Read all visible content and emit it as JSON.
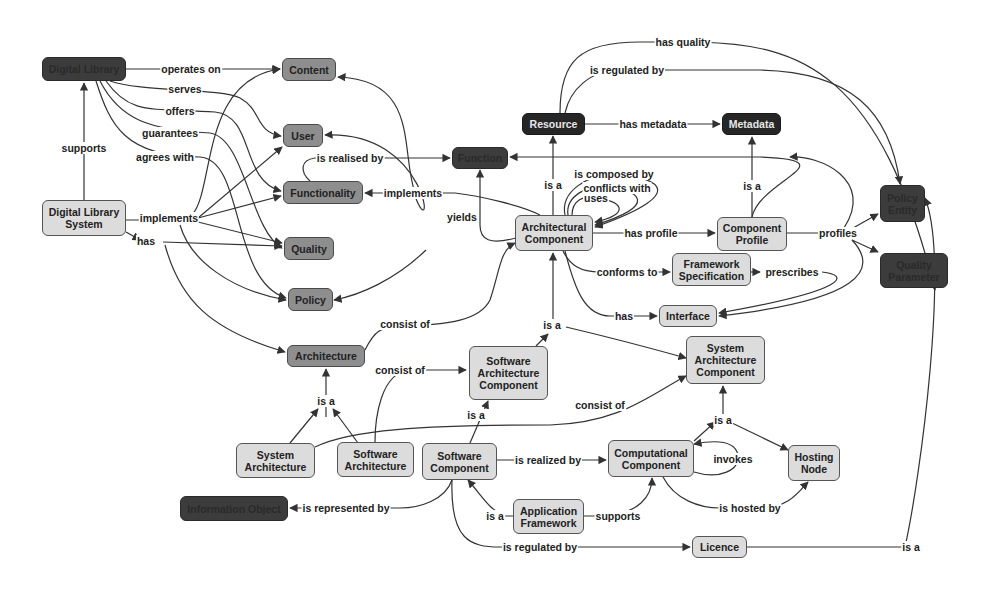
{
  "diagram": {
    "title": "",
    "colors": {
      "light": "#dcdcdc",
      "mid": "#8e8e8e",
      "dark": "#3c3c3c",
      "black": "#262626",
      "edge": "#333333"
    },
    "nodes": [
      {
        "id": "digital_library",
        "label": "Digital Library",
        "style": "dark",
        "x": 42,
        "y": 57,
        "w": 84,
        "h": 24
      },
      {
        "id": "dls",
        "label": "Digital Library System",
        "style": "light",
        "x": 42,
        "y": 200,
        "w": 84,
        "h": 36
      },
      {
        "id": "content",
        "label": "Content",
        "style": "mid",
        "x": 282,
        "y": 58,
        "w": 54,
        "h": 23
      },
      {
        "id": "user",
        "label": "User",
        "style": "mid",
        "x": 283,
        "y": 124,
        "w": 40,
        "h": 23
      },
      {
        "id": "functionality",
        "label": "Functionality",
        "style": "mid",
        "x": 283,
        "y": 181,
        "w": 80,
        "h": 23
      },
      {
        "id": "quality",
        "label": "Quality",
        "style": "mid",
        "x": 284,
        "y": 237,
        "w": 50,
        "h": 23
      },
      {
        "id": "policy",
        "label": "Policy",
        "style": "mid",
        "x": 288,
        "y": 288,
        "w": 45,
        "h": 23
      },
      {
        "id": "architecture",
        "label": "Architecture",
        "style": "mid",
        "x": 287,
        "y": 345,
        "w": 78,
        "h": 22
      },
      {
        "id": "function",
        "label": "Function",
        "style": "dark",
        "x": 452,
        "y": 147,
        "w": 56,
        "h": 22
      },
      {
        "id": "resource",
        "label": "Resource",
        "style": "black",
        "x": 522,
        "y": 113,
        "w": 63,
        "h": 22
      },
      {
        "id": "metadata",
        "label": "Metadata",
        "style": "black",
        "x": 722,
        "y": 113,
        "w": 59,
        "h": 22
      },
      {
        "id": "arch_component",
        "label": "Architectural Component",
        "style": "light",
        "x": 515,
        "y": 215,
        "w": 78,
        "h": 36
      },
      {
        "id": "component_profile",
        "label": "Component Profile",
        "style": "light",
        "x": 717,
        "y": 217,
        "w": 70,
        "h": 34
      },
      {
        "id": "framework_spec",
        "label": "Framework Specification",
        "style": "light",
        "x": 672,
        "y": 253,
        "w": 79,
        "h": 33
      },
      {
        "id": "interface",
        "label": "Interface",
        "style": "light",
        "x": 659,
        "y": 305,
        "w": 58,
        "h": 22
      },
      {
        "id": "policy_entity",
        "label": "Policy Entity",
        "style": "dark",
        "x": 880,
        "y": 185,
        "w": 45,
        "h": 37
      },
      {
        "id": "quality_parameter",
        "label": "Quality Parameter",
        "style": "dark",
        "x": 880,
        "y": 253,
        "w": 68,
        "h": 35
      },
      {
        "id": "sw_arch_component",
        "label": "Software Architecture Component",
        "style": "light",
        "x": 469,
        "y": 346,
        "w": 79,
        "h": 54
      },
      {
        "id": "sys_arch_component",
        "label": "System Architecture Component",
        "style": "light",
        "x": 686,
        "y": 336,
        "w": 79,
        "h": 48
      },
      {
        "id": "system_architecture",
        "label": "System Architecture",
        "style": "light",
        "x": 236,
        "y": 443,
        "w": 79,
        "h": 35
      },
      {
        "id": "software_architecture",
        "label": "Software Architecture",
        "style": "light",
        "x": 337,
        "y": 442,
        "w": 77,
        "h": 35
      },
      {
        "id": "software_component",
        "label": "Software Component",
        "style": "light",
        "x": 422,
        "y": 443,
        "w": 75,
        "h": 37
      },
      {
        "id": "computational_component",
        "label": "Computational Component",
        "style": "light",
        "x": 608,
        "y": 440,
        "w": 86,
        "h": 37
      },
      {
        "id": "hosting_node",
        "label": "Hosting Node",
        "style": "light",
        "x": 788,
        "y": 445,
        "w": 52,
        "h": 36
      },
      {
        "id": "information_object",
        "label": "Information Object",
        "style": "dark",
        "x": 180,
        "y": 496,
        "w": 108,
        "h": 25
      },
      {
        "id": "application_framework",
        "label": "Application Framework",
        "style": "light",
        "x": 513,
        "y": 499,
        "w": 71,
        "h": 35
      },
      {
        "id": "licence",
        "label": "Licence",
        "style": "light",
        "x": 692,
        "y": 536,
        "w": 55,
        "h": 22
      }
    ],
    "edges": [
      {
        "label": "operates on",
        "path": "M126 69 L280 69",
        "lx": 191,
        "ly": 69
      },
      {
        "label": "serves",
        "path": "M110 81 C140 92 220 88 240 98 C262 110 255 132 281 136",
        "lx": 185,
        "ly": 89
      },
      {
        "label": "offers",
        "path": "M106 81 C130 115 150 108 215 112 C255 116 240 180 281 191",
        "lx": 180,
        "ly": 111
      },
      {
        "label": "guarantees",
        "path": "M100 81 C120 120 150 130 210 133 C245 138 250 230 282 248",
        "lx": 170,
        "ly": 133
      },
      {
        "label": "agrees with",
        "path": "M96 81 C110 125 125 157 200 157 C245 160 230 280 286 298",
        "lx": 165,
        "ly": 157
      },
      {
        "label": "supports",
        "path": "M84 200 L84 83",
        "lx": 84,
        "ly": 148
      },
      {
        "label": "implements",
        "path": "M126 220 L160 220",
        "lx": 169,
        "ly": 218
      },
      {
        "label": "",
        "path": "M192 215 C215 190 200 80 280 69",
        "lx": 0,
        "ly": 0
      },
      {
        "label": "",
        "path": "M198 218 L282 147",
        "lx": 0,
        "ly": 0
      },
      {
        "label": "",
        "path": "M198 218 L281 196",
        "lx": 0,
        "ly": 0
      },
      {
        "label": "",
        "path": "M198 222 L282 243",
        "lx": 0,
        "ly": 0
      },
      {
        "label": "",
        "path": "M180 225 C190 260 230 290 286 300",
        "lx": 0,
        "ly": 0
      },
      {
        "label": "has",
        "path": "M126 232 L140 240",
        "lx": 146,
        "ly": 241
      },
      {
        "label": "",
        "path": "M163 242 L282 246",
        "lx": 0,
        "ly": 0
      },
      {
        "label": "",
        "path": "M165 245 C180 300 210 330 285 352",
        "lx": 0,
        "ly": 0
      },
      {
        "label": "is realised by",
        "path": "M310 181 C300 172 300 160 315 158 L450 158",
        "lx": 350,
        "ly": 158
      },
      {
        "label": "implements",
        "path": "M540 215 C520 205 480 196 455 193 L365 193",
        "lx": 413,
        "ly": 193
      },
      {
        "label": "",
        "path": "M415 193 C400 150 420 80 338 77",
        "lx": 0,
        "ly": 0
      },
      {
        "label": "",
        "path": "M415 196 C435 250 430 130 325 135",
        "lx": 0,
        "ly": 0
      },
      {
        "label": "",
        "path": "M426 250 C395 280 360 295 334 300",
        "lx": 0,
        "ly": 0
      },
      {
        "label": "yields",
        "path": "M516 238 C490 245 480 240 480 225 L480 170",
        "lx": 462,
        "ly": 217
      },
      {
        "label": "is a",
        "path": "M553 215 L553 136",
        "lx": 553,
        "ly": 185
      },
      {
        "label": "has metadata",
        "path": "M585 124 L720 124",
        "lx": 653,
        "ly": 124
      },
      {
        "label": "has quality",
        "path": "M560 113 C560 60 580 42 640 42 L700 42 C800 45 880 70 935 290",
        "lx": 683,
        "ly": 42
      },
      {
        "label": "is regulated by",
        "path": "M565 113 C570 90 590 70 620 70 L760 70 C850 72 890 110 900 184",
        "lx": 627,
        "ly": 70
      },
      {
        "label": "",
        "path": "M752 217 C760 180 850 160 760 157 L510 157",
        "lx": 0,
        "ly": 0
      },
      {
        "label": "is composed by",
        "path": "M565 215 C560 190 590 175 610 175 C650 175 700 190 595 227",
        "lx": 614,
        "ly": 174
      },
      {
        "label": "conflicts with",
        "path": "M568 215 C565 195 590 185 605 186 C640 190 660 205 595 225",
        "lx": 617,
        "ly": 188
      },
      {
        "label": "uses",
        "path": "M572 215 C572 200 585 195 593 198 C625 200 630 215 595 222",
        "lx": 596,
        "ly": 198
      },
      {
        "label": "has profile",
        "path": "M593 233 L715 233",
        "lx": 651,
        "ly": 233
      },
      {
        "label": "is a",
        "path": "M752 217 L752 137",
        "lx": 752,
        "ly": 186
      },
      {
        "label": "profiles",
        "path": "M787 233 L830 233",
        "lx": 838,
        "ly": 233
      },
      {
        "label": "",
        "path": "M853 228 L878 214",
        "lx": 0,
        "ly": 0
      },
      {
        "label": "",
        "path": "M852 240 L878 252",
        "lx": 0,
        "ly": 0
      },
      {
        "label": "",
        "path": "M844 228 C875 180 820 155 790 157",
        "lx": 0,
        "ly": 0
      },
      {
        "label": "conforms to",
        "path": "M563 251 C570 265 580 272 600 272 L670 272",
        "lx": 627,
        "ly": 272
      },
      {
        "label": "prescribes",
        "path": "M751 272 L760 272",
        "lx": 792,
        "ly": 272
      },
      {
        "label": "",
        "path": "M822 272 C850 275 850 290 719 313",
        "lx": 0,
        "ly": 0
      },
      {
        "label": "",
        "path": "M852 240 C880 270 860 300 719 316",
        "lx": 0,
        "ly": 0
      },
      {
        "label": "has",
        "path": "M565 251 C575 290 585 316 610 316 L657 316",
        "lx": 624,
        "ly": 316
      },
      {
        "label": "is a",
        "path": "M553 326 L553 253",
        "lx": 552,
        "ly": 325
      },
      {
        "label": "",
        "path": "M536 346 L548 334",
        "lx": 0,
        "ly": 0
      },
      {
        "label": "",
        "path": "M566 327 C600 335 650 348 686 358",
        "lx": 0,
        "ly": 0
      },
      {
        "label": "consist of",
        "path": "M365 350 C375 330 380 328 400 326 C450 325 480 320 490 300 C500 270 500 250 515 243",
        "lx": 405,
        "ly": 324
      },
      {
        "label": "is a",
        "path": "M326 417 L326 369",
        "lx": 326,
        "ly": 401
      },
      {
        "label": "",
        "path": "M290 443 L318 409",
        "lx": 0,
        "ly": 0
      },
      {
        "label": "",
        "path": "M358 443 L333 409",
        "lx": 0,
        "ly": 0
      },
      {
        "label": "consist of",
        "path": "M375 442 C375 420 380 372 410 370 L466 370",
        "lx": 400,
        "ly": 370
      },
      {
        "label": "is a",
        "path": "M470 443 L488 401",
        "lx": 476,
        "ly": 415
      },
      {
        "label": "consist of",
        "path": "M315 447 C350 430 420 425 550 425 C620 423 650 395 686 376",
        "lx": 600,
        "ly": 405
      },
      {
        "label": "is realized by",
        "path": "M497 460 L606 460",
        "lx": 548,
        "ly": 460
      },
      {
        "label": "is a",
        "path": "M723 421 L723 386",
        "lx": 723,
        "ly": 420
      },
      {
        "label": "",
        "path": "M694 441 L715 422",
        "lx": 0,
        "ly": 0
      },
      {
        "label": "",
        "path": "M732 423 L788 450",
        "lx": 0,
        "ly": 0
      },
      {
        "label": "invokes",
        "path": "M694 472 C720 480 740 470 738 455 C735 440 715 440 694 444",
        "lx": 733,
        "ly": 459
      },
      {
        "label": "is hosted by",
        "path": "M663 477 C675 500 700 508 720 508 L760 508 C790 508 800 490 808 482",
        "lx": 750,
        "ly": 508
      },
      {
        "label": "supports",
        "path": "M584 516 L600 516 C640 515 652 495 652 478",
        "lx": 618,
        "ly": 516
      },
      {
        "label": "is a",
        "path": "M513 516 L505 516 C490 510 485 500 468 480",
        "lx": 495,
        "ly": 516
      },
      {
        "label": "is represented by",
        "path": "M452 480 C445 500 420 508 400 508 L290 508",
        "lx": 346,
        "ly": 508
      },
      {
        "label": "is regulated by",
        "path": "M452 480 C450 540 470 547 500 547 L690 547",
        "lx": 540,
        "ly": 547
      },
      {
        "label": "is a",
        "path": "M747 547 L905 547 C920 480 950 260 925 198",
        "lx": 911,
        "ly": 547
      }
    ]
  }
}
